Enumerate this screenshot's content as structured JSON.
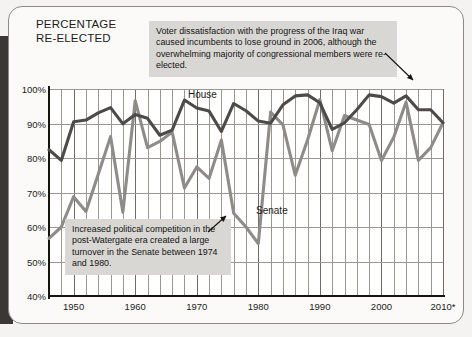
{
  "figure": {
    "title": "PERCENTAGE\nRE-ELECTED",
    "series_labels": {
      "house": "House",
      "senate": "Senate"
    },
    "callouts": {
      "iraq": "Voter dissatisfaction with the progress of the Iraq war caused incumbents to lose ground in 2006, although the overwhelming majority of congressional members were re-elected.",
      "watergate": "Increased political competition in the post-Watergate era created a large turnover in the Senate between 1974 and 1980."
    }
  },
  "chart_data": {
    "type": "line",
    "title": "PERCENTAGE RE-ELECTED",
    "xlabel": "",
    "ylabel": "PERCENTAGE RE-ELECTED",
    "xlim": [
      1946,
      2010
    ],
    "ylim": [
      40,
      100
    ],
    "grid": true,
    "grid_x_step": 2,
    "grid_y_step": 10,
    "legend": "inline-labels",
    "y_ticks": [
      "40%",
      "50%",
      "60%",
      "70%",
      "80%",
      "90%",
      "100%"
    ],
    "y_tick_values": [
      40,
      50,
      60,
      70,
      80,
      90,
      100
    ],
    "x_ticks": [
      "1950",
      "1960",
      "1970",
      "1980",
      "1990",
      "2000",
      "2010*"
    ],
    "x_tick_values": [
      1950,
      1960,
      1970,
      1980,
      1990,
      2000,
      2010
    ],
    "x": [
      1946,
      1948,
      1950,
      1952,
      1954,
      1956,
      1958,
      1960,
      1962,
      1964,
      1966,
      1968,
      1970,
      1972,
      1974,
      1976,
      1978,
      1980,
      1982,
      1984,
      1986,
      1988,
      1990,
      1992,
      1994,
      1996,
      1998,
      2000,
      2002,
      2004,
      2006,
      2008,
      2010
    ],
    "series": [
      {
        "name": "House",
        "color": "#4d4b49",
        "values": [
          82.4,
          79.3,
          90.5,
          91.0,
          93.1,
          94.6,
          89.9,
          92.6,
          91.5,
          86.6,
          88.1,
          96.8,
          94.5,
          93.6,
          87.7,
          95.8,
          93.7,
          90.7,
          90.1,
          95.4,
          98.0,
          98.3,
          96.0,
          88.3,
          90.2,
          94.0,
          98.3,
          97.8,
          95.9,
          98.0,
          94.0,
          94.0,
          90.2
        ]
      },
      {
        "name": "Senate",
        "color": "#8e8c88",
        "values": [
          56.7,
          60.0,
          68.8,
          64.5,
          75.3,
          86.2,
          64.3,
          96.6,
          83.0,
          84.8,
          87.5,
          71.3,
          77.4,
          74.1,
          85.2,
          64.0,
          60.0,
          55.2,
          93.3,
          89.6,
          75.0,
          85.2,
          96.9,
          82.1,
          92.3,
          91.0,
          89.7,
          79.3,
          86.0,
          96.2,
          79.3,
          83.0,
          90.2
        ]
      }
    ],
    "annotations": [
      {
        "id": "iraq",
        "text": "Voter dissatisfaction with the progress of the Iraq war caused incumbents to lose ground in 2006, although the overwhelming majority of congressional members were re-elected.",
        "points_to_year": 2006,
        "points_to_series": "House"
      },
      {
        "id": "watergate",
        "text": "Increased political competition in the post-Watergate era created a large turnover in the Senate between 1974 and 1980.",
        "points_to_year": 1980,
        "points_to_series": "Senate"
      }
    ]
  }
}
